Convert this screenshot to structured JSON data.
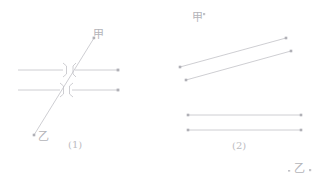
{
  "figure": {
    "background_color": "#ffffff",
    "stroke_color": "#c2c2c7",
    "dot_color": "#b0b0b6",
    "text_color": "#b9b9bd",
    "width": 318,
    "height": 186,
    "panels": [
      {
        "id": "panel-1",
        "caption": "(1)",
        "caption_position": {
          "x": 68,
          "y": 140
        },
        "labels": [
          {
            "name": "jia",
            "text": "甲",
            "x": 93,
            "y": 29
          },
          {
            "name": "yi",
            "text": "乙",
            "x": 38,
            "y": 131
          }
        ],
        "horizontal_lines": [
          {
            "name": "upper-ray-left",
            "x1": 18,
            "y1": 70,
            "x2": 63,
            "y2": 70
          },
          {
            "name": "upper-ray-right",
            "x1": 75,
            "y1": 70,
            "x2": 118,
            "y2": 70
          },
          {
            "name": "lower-ray-left",
            "x1": 18,
            "y1": 90,
            "x2": 60,
            "y2": 90
          },
          {
            "name": "lower-ray-right",
            "x1": 72,
            "y1": 90,
            "x2": 118,
            "y2": 90
          }
        ],
        "diagonal_line": {
          "name": "jia-yi-axis",
          "x1": 34,
          "y1": 135,
          "x2": 94,
          "y2": 38
        },
        "break_brackets": [
          {
            "name": "break-upper-left",
            "path": "M 63,64 L 66,66 L 66,74 L 63,76"
          },
          {
            "name": "break-upper-right",
            "path": "M 76,64 L 73,66 L 73,74 L 76,76"
          },
          {
            "name": "break-lower-left",
            "path": "M 60,84 L 64,86 L 64,94 L 60,96"
          },
          {
            "name": "break-lower-right",
            "path": "M 73,84 L 70,86 L 70,94 L 73,96"
          }
        ],
        "endpoint_dots": [
          {
            "name": "dot-upper-right",
            "x": 118,
            "y": 70
          },
          {
            "name": "dot-lower-right",
            "x": 118,
            "y": 90
          },
          {
            "name": "dot-diagonal-top",
            "x": 94,
            "y": 38
          },
          {
            "name": "dot-diagonal-bottom",
            "x": 34,
            "y": 135
          }
        ]
      },
      {
        "id": "panel-2",
        "caption": "(2)",
        "caption_position": {
          "x": 232,
          "y": 141
        },
        "labels": [
          {
            "name": "jia",
            "text": "甲",
            "x": 192,
            "y": 12
          },
          {
            "name": "yi",
            "text": "乙",
            "x": 294,
            "y": 163
          }
        ],
        "slanted_lines": [
          {
            "name": "slant-upper",
            "x1": 180,
            "y1": 67,
            "x2": 286,
            "y2": 38
          },
          {
            "name": "slant-lower",
            "x1": 186,
            "y1": 80,
            "x2": 291,
            "y2": 51
          }
        ],
        "horizontal_lines": [
          {
            "name": "flat-upper",
            "x1": 188,
            "y1": 115,
            "x2": 301,
            "y2": 115
          },
          {
            "name": "flat-lower",
            "x1": 188,
            "y1": 130,
            "x2": 301,
            "y2": 130
          }
        ],
        "endpoint_dots": [
          {
            "name": "dot-slant-upper-left",
            "x": 180,
            "y": 67
          },
          {
            "name": "dot-slant-upper-right",
            "x": 286,
            "y": 38
          },
          {
            "name": "dot-slant-lower-left",
            "x": 186,
            "y": 80
          },
          {
            "name": "dot-slant-lower-right",
            "x": 291,
            "y": 51
          },
          {
            "name": "dot-flat-upper-left",
            "x": 188,
            "y": 115
          },
          {
            "name": "dot-flat-upper-right",
            "x": 301,
            "y": 115
          },
          {
            "name": "dot-flat-lower-left",
            "x": 188,
            "y": 130
          },
          {
            "name": "dot-flat-lower-right",
            "x": 301,
            "y": 130
          }
        ],
        "tick_marks": [
          {
            "name": "tick-jia-superscript",
            "x": 203,
            "y": 13
          },
          {
            "name": "tick-yi-left",
            "x": 288,
            "y": 170
          },
          {
            "name": "tick-yi-right",
            "x": 309,
            "y": 169
          }
        ]
      }
    ]
  }
}
